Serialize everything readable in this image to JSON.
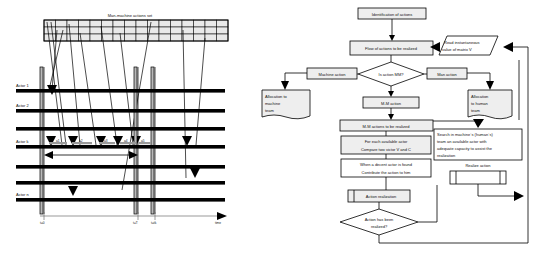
{
  "figure": {
    "panels": [
      "timeline-diagram",
      "allocation-flowchart"
    ]
  },
  "left_diagram": {
    "name": "actors-timeline-diagram",
    "grid_title": "Man-machine actions set",
    "grid": {
      "rows": 3,
      "cols": 18
    },
    "actor_labels": [
      "Actor 1",
      "Actor 2",
      "Actor k",
      "Actor n"
    ],
    "actor_rows": 7,
    "action_labels": [
      "a1",
      "a2",
      "a3",
      "a4",
      "a5"
    ],
    "axis_label": "time",
    "time_ticks": [
      "t=0",
      "t=T",
      "t=tk"
    ],
    "span_marker": "duration-span-arrow"
  },
  "flowchart": {
    "name": "allocation-flowchart",
    "nodes": {
      "identification": "Identification of actions",
      "flow": "Flow of actions to be realized",
      "read_matrix": "Read instantaneous value of matrix V",
      "decision_mm": "Is action MM?",
      "machine_action": "Machine action",
      "man_action": "Man action",
      "alloc_machine": "Allocation to machine team",
      "alloc_human": "Allocation to human team",
      "mm_action": "M-M action",
      "mm_to_realize": "M-M actions to be realized",
      "compare": "For each available actor Compare two victor V and C",
      "compare_line1": "For each available actor",
      "compare_line2": "Compare two victor V and C",
      "contribute_line1": "When a decent actor is found",
      "contribute_line2": "Contribute the action to him",
      "search_team": "Search in machine´s (human´s) team an available actor with adequate capacity to assist the realization",
      "search_line1": "Search in machine´s (human´s)",
      "search_line2": "team an available actor with",
      "search_line3": "adequate capacity to assist the",
      "search_line4": "realization",
      "realize_action": "Realize action",
      "action_realization": "Action realization",
      "decision_done_line1": "Action has been",
      "decision_done_line2": "realized?"
    }
  },
  "colors": {
    "box_fill": "#eeeeee",
    "box_stroke": "#000000",
    "grid_fill": "#e9e9e9",
    "bar": "#000000",
    "axis": "#6d6d6d"
  }
}
